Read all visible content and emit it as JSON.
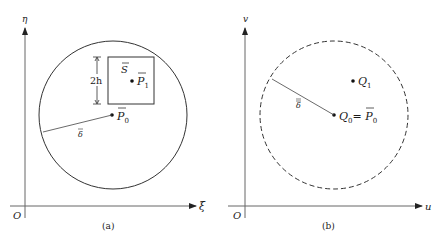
{
  "panels": [
    {
      "id": "a",
      "caption": "(a)",
      "axes": {
        "x_label": "ξ",
        "y_label": "η",
        "origin_label": "O"
      },
      "circle": {
        "style": "solid"
      },
      "square": {
        "label": "S",
        "height_label": "2h"
      },
      "points": [
        {
          "name": "P1",
          "label": "P",
          "sub": "1",
          "overbar": "single"
        },
        {
          "name": "P0",
          "label": "P",
          "sub": "0",
          "overbar": "single"
        }
      ],
      "radius_label": "δ",
      "radius_overbar": "single"
    },
    {
      "id": "b",
      "caption": "(b)",
      "axes": {
        "x_label": "u",
        "y_label": "v",
        "origin_label": "O"
      },
      "circle": {
        "style": "dashed"
      },
      "points": [
        {
          "name": "Q1",
          "label": "Q",
          "sub": "1"
        },
        {
          "name": "Q0",
          "label": "Q",
          "sub": "0",
          "equals": "= ",
          "equals_label": "P",
          "equals_sub": "0",
          "equals_overbar": "single"
        }
      ],
      "radius_label": "δ",
      "radius_overbar": "double"
    }
  ],
  "colors": {
    "stroke": "#2b2b2b",
    "axis": "#555555",
    "background": "#ffffff"
  }
}
